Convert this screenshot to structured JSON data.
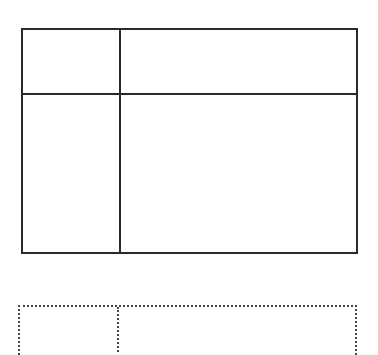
{
  "diagram": {
    "colors": {
      "background": "#ffffff",
      "solid_stroke": "#2a2a2a",
      "dotted_stroke": "#444444"
    },
    "solid_grid": {
      "left": 21,
      "top": 28,
      "right": 358,
      "bottom": 254,
      "vertical_divider_x": 119,
      "horizontal_divider_y": 93,
      "cells": [
        "top-left",
        "top-right",
        "bottom-left",
        "bottom-right"
      ]
    },
    "dotted_grid": {
      "left": 18,
      "top": 305,
      "right": 357,
      "vertical_divider_x": 117,
      "clipped_at_bottom": true
    }
  }
}
